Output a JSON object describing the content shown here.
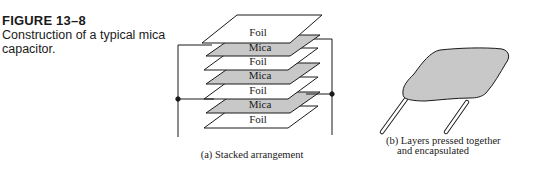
{
  "figure": {
    "number": "FIGURE 13–8",
    "caption": "Construction of a typical mica capacitor."
  },
  "panel_a": {
    "caption": "(a) Stacked arrangement",
    "layers": [
      {
        "label": "Foil",
        "type": "foil"
      },
      {
        "label": "Mica",
        "type": "mica"
      },
      {
        "label": "Foil",
        "type": "foil"
      },
      {
        "label": "Mica",
        "type": "mica"
      },
      {
        "label": "Foil",
        "type": "foil"
      },
      {
        "label": "Mica",
        "type": "mica"
      },
      {
        "label": "Foil",
        "type": "foil"
      }
    ]
  },
  "panel_b": {
    "caption_line1": "(b) Layers pressed together",
    "caption_line2": "and encapsulated"
  },
  "colors": {
    "foil": "#ffffff",
    "mica": "#c8c8c8",
    "stroke": "#1a1a1a",
    "encapsulation": "#c8c8c8"
  }
}
